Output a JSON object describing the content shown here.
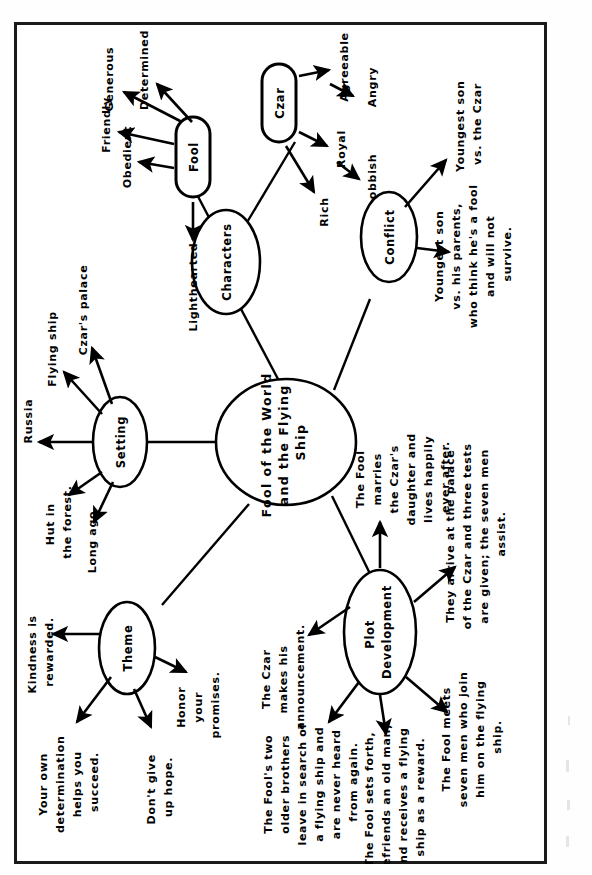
{
  "document": {
    "type": "concept-map",
    "title_node": "Fool of the World and the Flying Ship",
    "orientation": "rotated-90-counterclockwise",
    "ink_color": "#000000",
    "page_color": "#ffffff"
  },
  "center": {
    "label": "Fool of the World and the Flying Ship",
    "lines": [
      "Fool of the World",
      "and the Flying",
      "Ship"
    ]
  },
  "branches": [
    {
      "id": "characters",
      "label": "Characters",
      "children": [
        {
          "id": "fool",
          "label": "Fool",
          "shape": "rounded-rect",
          "traits": [
            {
              "label": "Determined"
            },
            {
              "label": "Generous"
            },
            {
              "label": "Friendly"
            },
            {
              "label": "Obedient"
            },
            {
              "label": "Lighthearted"
            }
          ]
        },
        {
          "id": "czar",
          "label": "Czar",
          "shape": "rounded-rect",
          "traits": [
            {
              "label": "Agreeable"
            },
            {
              "label": "Angry"
            },
            {
              "label": "Royal"
            },
            {
              "label": "Snobbish"
            },
            {
              "label": "Rich"
            }
          ]
        }
      ]
    },
    {
      "id": "setting",
      "label": "Setting",
      "children": [
        {
          "label": "Czar's palace",
          "lines": [
            "Czar's palace"
          ]
        },
        {
          "label": "Flying ship",
          "lines": [
            "Flying ship"
          ]
        },
        {
          "label": "Russia",
          "lines": [
            "Russia"
          ]
        },
        {
          "label": "Hut in the forest.",
          "lines": [
            "Hut in",
            "the forest."
          ]
        },
        {
          "label": "Long ago",
          "lines": [
            "Long ago"
          ]
        }
      ]
    },
    {
      "id": "conflict",
      "label": "Conflict",
      "children": [
        {
          "label": "Youngest son vs. the Czar",
          "lines": [
            "Youngest son",
            "vs. the Czar"
          ]
        },
        {
          "label": "Youngest son vs. his parents, who think he's a fool and will not survive.",
          "lines": [
            "Youngest son",
            "vs. his parents,",
            "who think he's a fool",
            "and will not",
            "survive."
          ]
        }
      ]
    },
    {
      "id": "theme",
      "label": "Theme",
      "children": [
        {
          "label": "Kindness is rewarded.",
          "lines": [
            "Kindness is",
            "rewarded."
          ]
        },
        {
          "label": "Your own determination helps you succeed.",
          "lines": [
            "Your own",
            "determination",
            "helps you",
            "succeed."
          ]
        },
        {
          "label": "Don't give up hope.",
          "lines": [
            "Don't give",
            "up hope."
          ]
        },
        {
          "label": "Honor your promises.",
          "lines": [
            "Honor",
            "your",
            "promises."
          ]
        }
      ]
    },
    {
      "id": "plot-development",
      "label": "Plot Development",
      "lines": [
        "Plot",
        "Development"
      ],
      "children": [
        {
          "label": "The Czar makes his announcement.",
          "lines": [
            "The Czar",
            "makes his",
            "announcement."
          ]
        },
        {
          "label": "The Fool's two older brothers leave in search of a flying ship and are never heard from again.",
          "lines": [
            "The Fool's two",
            "older brothers",
            "leave in search of",
            "a flying ship and",
            "are never heard",
            "from again."
          ]
        },
        {
          "label": "The Fool sets forth, befriends an old man, and receives a flying ship as a reward.",
          "lines": [
            "The Fool sets forth,",
            "befriends an old man,",
            "and receives a flying",
            "ship as a reward."
          ]
        },
        {
          "label": "The Fool meets seven men who join him on the flying ship.",
          "lines": [
            "The Fool meets",
            "seven men who join",
            "him on the flying",
            "ship."
          ]
        },
        {
          "label": "They arrive at the palace of the Czar and three tests are given; the seven men assist.",
          "lines": [
            "They arrive at the palace",
            "of the Czar and three tests",
            "are given; the seven men",
            "assist."
          ]
        },
        {
          "label": "The Fool marries the Czar's daughter and lives happily ever after.",
          "lines": [
            "The Fool",
            "marries",
            "the Czar's",
            "daughter and",
            "lives happily",
            "ever after."
          ]
        }
      ]
    }
  ]
}
